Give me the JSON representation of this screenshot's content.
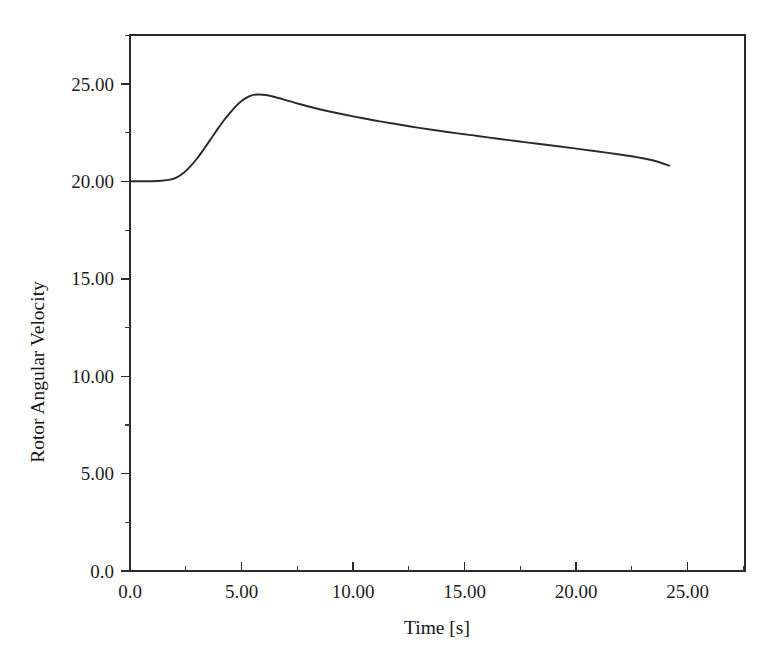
{
  "figure": {
    "background_color": "#ffffff",
    "frame_color": "#2b2b2b",
    "curve_color": "#2a2a2a"
  },
  "chart_data": {
    "type": "line",
    "title": "",
    "xlabel": "Time [s]",
    "ylabel": "Rotor Angular Velocity",
    "xlim": [
      0.0,
      27.6
    ],
    "ylim": [
      0.0,
      27.5
    ],
    "grid": false,
    "legend": null,
    "x_ticks": [
      {
        "value": 0.0,
        "label": "0.0"
      },
      {
        "value": 5.0,
        "label": "5.00"
      },
      {
        "value": 10.0,
        "label": "10.00"
      },
      {
        "value": 15.0,
        "label": "15.00"
      },
      {
        "value": 20.0,
        "label": "20.00"
      },
      {
        "value": 25.0,
        "label": "25.00"
      }
    ],
    "x_minor_ticks": [
      2.5,
      7.5,
      12.5,
      17.5,
      22.5
    ],
    "y_ticks": [
      {
        "value": 0.0,
        "label": "0.0"
      },
      {
        "value": 5.0,
        "label": "5.00"
      },
      {
        "value": 10.0,
        "label": "10.00"
      },
      {
        "value": 15.0,
        "label": "15.00"
      },
      {
        "value": 20.0,
        "label": "20.00"
      },
      {
        "value": 25.0,
        "label": "25.00"
      }
    ],
    "y_minor_ticks": [
      2.5,
      7.5,
      12.5,
      17.5,
      22.5
    ],
    "series": [
      {
        "name": "Rotor Angular Velocity",
        "color": "#2a2a2a",
        "x": [
          0.0,
          0.5,
          1.0,
          1.4,
          1.8,
          2.1,
          2.4,
          2.7,
          3.0,
          3.3,
          3.6,
          3.9,
          4.2,
          4.5,
          4.8,
          5.05,
          5.3,
          5.55,
          5.8,
          6.1,
          6.5,
          7.0,
          7.6,
          8.2,
          8.9,
          9.6,
          10.4,
          11.2,
          12.0,
          12.9,
          13.8,
          14.7,
          15.6,
          16.5,
          17.4,
          18.3,
          19.2,
          20.1,
          21.0,
          21.9,
          22.8,
          23.5,
          24.2
        ],
        "y": [
          20.0,
          20.0,
          20.0,
          20.02,
          20.08,
          20.2,
          20.42,
          20.75,
          21.15,
          21.62,
          22.12,
          22.62,
          23.1,
          23.52,
          23.9,
          24.15,
          24.33,
          24.43,
          24.45,
          24.42,
          24.32,
          24.16,
          23.96,
          23.78,
          23.59,
          23.42,
          23.24,
          23.07,
          22.92,
          22.75,
          22.6,
          22.45,
          22.32,
          22.18,
          22.05,
          21.92,
          21.79,
          21.66,
          21.52,
          21.38,
          21.22,
          21.06,
          20.8
        ],
        "annotations": {
          "initial_value": 20.0,
          "peak_value": 24.45,
          "peak_time": 5.7,
          "final_value": 20.8,
          "final_time": 24.2
        }
      }
    ]
  }
}
